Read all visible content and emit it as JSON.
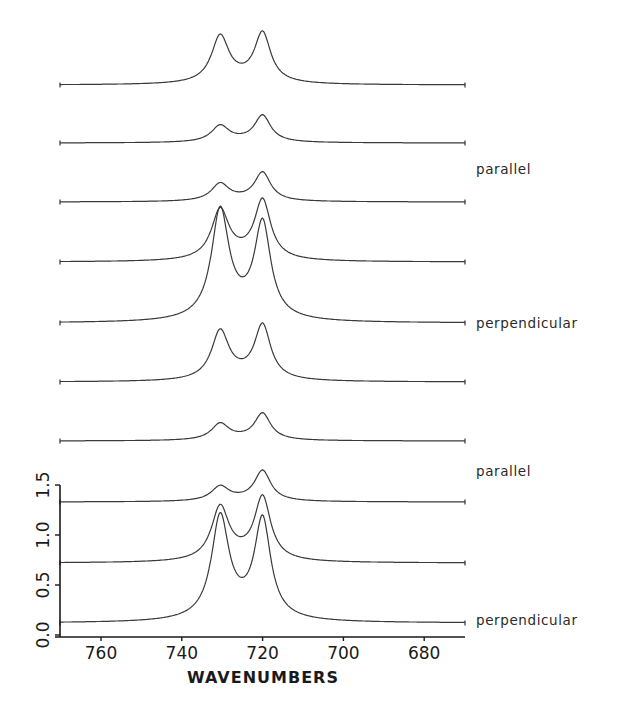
{
  "chart_data": {
    "type": "line",
    "title": "",
    "xlabel": "WAVENUMBERS",
    "ylabel": "",
    "xlim": [
      770,
      670
    ],
    "ylim": [
      0.0,
      1.5
    ],
    "x_ticks": [
      760,
      740,
      720,
      700,
      680
    ],
    "y_ticks": [
      {
        "value": 0.0,
        "label": "0.0"
      },
      {
        "value": 0.5,
        "label": "0.5"
      },
      {
        "value": 1.0,
        "label": "1.0"
      },
      {
        "value": 1.5,
        "label": "1.5"
      }
    ],
    "grid": false,
    "legend": "none",
    "series": [
      {
        "name": "spectrum-1",
        "baseline": 5.5,
        "peaks": [
          {
            "x": 730.5,
            "height": 0.49
          },
          {
            "x": 720.0,
            "height": 0.52
          }
        ]
      },
      {
        "name": "spectrum-2",
        "baseline": 4.92,
        "peaks": [
          {
            "x": 730.5,
            "height": 0.17
          },
          {
            "x": 720.0,
            "height": 0.28
          }
        ]
      },
      {
        "name": "spectrum-3",
        "baseline": 4.33,
        "peaks": [
          {
            "x": 730.5,
            "height": 0.18
          },
          {
            "x": 720.0,
            "height": 0.3
          }
        ]
      },
      {
        "name": "spectrum-4",
        "baseline": 3.73,
        "peaks": [
          {
            "x": 730.5,
            "height": 0.52
          },
          {
            "x": 720.0,
            "height": 0.62
          }
        ]
      },
      {
        "name": "spectrum-5",
        "baseline": 3.12,
        "peaks": [
          {
            "x": 730.5,
            "height": 1.14
          },
          {
            "x": 720.0,
            "height": 0.99
          }
        ]
      },
      {
        "name": "spectrum-6",
        "baseline": 2.53,
        "peaks": [
          {
            "x": 730.5,
            "height": 0.51
          },
          {
            "x": 720.0,
            "height": 0.57
          }
        ]
      },
      {
        "name": "spectrum-7",
        "baseline": 1.94,
        "peaks": [
          {
            "x": 730.5,
            "height": 0.17
          },
          {
            "x": 720.0,
            "height": 0.28
          }
        ]
      },
      {
        "name": "spectrum-8",
        "baseline": 1.33,
        "peaks": [
          {
            "x": 730.5,
            "height": 0.15
          },
          {
            "x": 720.0,
            "height": 0.32
          }
        ]
      },
      {
        "name": "spectrum-9",
        "baseline": 0.72,
        "peaks": [
          {
            "x": 730.5,
            "height": 0.56
          },
          {
            "x": 720.0,
            "height": 0.66
          }
        ]
      },
      {
        "name": "spectrum-10",
        "baseline": 0.12,
        "peaks": [
          {
            "x": 730.5,
            "height": 1.07
          },
          {
            "x": 720.0,
            "height": 1.03
          }
        ]
      }
    ],
    "annotations": [
      {
        "text": "parallel",
        "near_series": "spectrum-3"
      },
      {
        "text": "perpendicular",
        "near_series": "spectrum-5"
      },
      {
        "text": "parallel",
        "near_series": "spectrum-8"
      },
      {
        "text": "perpendicular",
        "near_series": "spectrum-10"
      }
    ]
  },
  "layout": {
    "x_px_per_unit": 4.04,
    "x_origin_value": 760,
    "x_origin_px": 101,
    "y_px_per_unit": 100,
    "y_zero_px": 635,
    "x_start_px": 60,
    "x_end_px": 465,
    "annotation_px": [
      {
        "x": 476,
        "y": 174
      },
      {
        "x": 476,
        "y": 328
      },
      {
        "x": 476,
        "y": 476
      },
      {
        "x": 476,
        "y": 625
      }
    ]
  }
}
